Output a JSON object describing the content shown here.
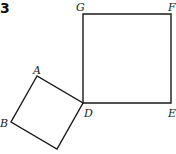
{
  "figure": {
    "number": "3",
    "shapes": [
      {
        "name": "square-GFED",
        "vertices": [
          "G",
          "F",
          "E",
          "D"
        ],
        "points": [
          [
            83,
            14
          ],
          [
            171,
            14
          ],
          [
            171,
            103
          ],
          [
            83,
            103
          ]
        ]
      },
      {
        "name": "square-ABCD",
        "vertices": [
          "A",
          "B",
          "C",
          "D"
        ],
        "points": [
          [
            37,
            76
          ],
          [
            11,
            122
          ],
          [
            57,
            149
          ],
          [
            83,
            103
          ]
        ]
      }
    ],
    "labels": {
      "G": "G",
      "F": "F",
      "E": "E",
      "D": "D",
      "A": "A",
      "B": "B"
    }
  }
}
